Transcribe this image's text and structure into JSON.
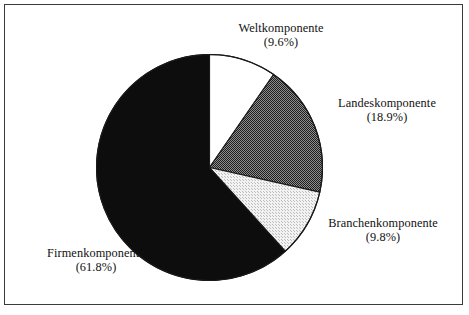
{
  "figure": {
    "background_color": "#ffffff",
    "border_color": "#3a3a3a"
  },
  "chart_data": {
    "type": "pie",
    "title": "",
    "subtitle": "",
    "xlabel": "",
    "ylabel": "",
    "legend_position": "none",
    "grid": false,
    "start_angle_deg": 0,
    "direction": "clockwise",
    "categories": [
      "Weltkomponente",
      "Landeskomponente",
      "Branchenkomponente",
      "Firmenkomponente"
    ],
    "values": [
      9.6,
      18.9,
      9.8,
      61.8
    ],
    "value_unit": "%",
    "slices": [
      {
        "label": "Weltkomponente",
        "value": 9.6,
        "value_text": "(9.6%)",
        "color": "#ffffff",
        "fill_style": "solid-white",
        "start_deg": 0.0,
        "end_deg": 34.56
      },
      {
        "label": "Landeskomponente",
        "value": 18.9,
        "value_text": "(18.9%)",
        "color": "#565656",
        "fill_style": "checker-50",
        "start_deg": 34.56,
        "end_deg": 102.6
      },
      {
        "label": "Branchenkomponente",
        "value": 9.8,
        "value_text": "(9.8%)",
        "color": "#e3e3e3",
        "fill_style": "checker-light",
        "start_deg": 102.6,
        "end_deg": 137.88
      },
      {
        "label": "Firmenkomponente",
        "value": 61.8,
        "value_text": "(61.8%)",
        "color": "#0d0d0d",
        "fill_style": "solid-black",
        "start_deg": 137.88,
        "end_deg": 360.0
      }
    ],
    "outline_color": "#1a1a1a",
    "total": 100.1
  },
  "labels": {
    "welt": {
      "name": "Weltkomponente",
      "pct": "(9.6%)"
    },
    "landes": {
      "name": "Landeskomponente",
      "pct": "(18.9%)"
    },
    "branchen": {
      "name": "Branchenkomponente",
      "pct": "(9.8%)"
    },
    "firmen": {
      "name": "Firmenkomponente",
      "pct": "(61.8%)"
    }
  }
}
